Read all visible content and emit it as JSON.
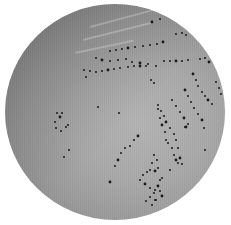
{
  "image": {
    "subject": "agar plate with bacterial colonies in streak pattern",
    "background_color": "#ffffff",
    "plate_color": "#a8a8a8",
    "colony_color": "#1a1a1a"
  },
  "colonies": [
    [
      152,
      22
    ],
    [
      160,
      19
    ],
    [
      176,
      34
    ],
    [
      182,
      33
    ],
    [
      186,
      35
    ],
    [
      163,
      42
    ],
    [
      157,
      44
    ],
    [
      150,
      45
    ],
    [
      143,
      46
    ],
    [
      135,
      47
    ],
    [
      128,
      48
    ],
    [
      122,
      49
    ],
    [
      116,
      50
    ],
    [
      110,
      51
    ],
    [
      96,
      58
    ],
    [
      102,
      60
    ],
    [
      110,
      61
    ],
    [
      118,
      60
    ],
    [
      126,
      59
    ],
    [
      132,
      62
    ],
    [
      140,
      63
    ],
    [
      148,
      64
    ],
    [
      156,
      66
    ],
    [
      164,
      61
    ],
    [
      170,
      61
    ],
    [
      176,
      61
    ],
    [
      182,
      61
    ],
    [
      188,
      60
    ],
    [
      200,
      59
    ],
    [
      205,
      58
    ],
    [
      209,
      62
    ],
    [
      84,
      70
    ],
    [
      90,
      71
    ],
    [
      96,
      72
    ],
    [
      102,
      71
    ],
    [
      108,
      70
    ],
    [
      114,
      69
    ],
    [
      120,
      68
    ],
    [
      128,
      67
    ],
    [
      134,
      66
    ],
    [
      140,
      66
    ],
    [
      146,
      66
    ],
    [
      86,
      77
    ],
    [
      151,
      80
    ],
    [
      154,
      83
    ],
    [
      193,
      74
    ],
    [
      196,
      80
    ],
    [
      198,
      86
    ],
    [
      202,
      92
    ],
    [
      205,
      96
    ],
    [
      208,
      100
    ],
    [
      212,
      104
    ],
    [
      216,
      82
    ],
    [
      219,
      88
    ],
    [
      221,
      94
    ],
    [
      185,
      90
    ],
    [
      188,
      96
    ],
    [
      191,
      102
    ],
    [
      194,
      108
    ],
    [
      198,
      114
    ],
    [
      202,
      120
    ],
    [
      204,
      128
    ],
    [
      172,
      100
    ],
    [
      176,
      106
    ],
    [
      180,
      112
    ],
    [
      184,
      118
    ],
    [
      188,
      124
    ],
    [
      158,
      105
    ],
    [
      161,
      111
    ],
    [
      164,
      116
    ],
    [
      166,
      122
    ],
    [
      170,
      128
    ],
    [
      174,
      134
    ],
    [
      176,
      140
    ],
    [
      178,
      148
    ],
    [
      180,
      158
    ],
    [
      182,
      164
    ],
    [
      98,
      107
    ],
    [
      119,
      113
    ],
    [
      57,
      113
    ],
    [
      60,
      117
    ],
    [
      55,
      122
    ],
    [
      62,
      113
    ],
    [
      158,
      109
    ],
    [
      160,
      118
    ],
    [
      162,
      125
    ],
    [
      165,
      132
    ],
    [
      166,
      140
    ],
    [
      185,
      127
    ],
    [
      205,
      150
    ],
    [
      186,
      127
    ],
    [
      56,
      128
    ],
    [
      61,
      131
    ],
    [
      66,
      127
    ],
    [
      68,
      125
    ],
    [
      138,
      136
    ],
    [
      134,
      140
    ],
    [
      130,
      146
    ],
    [
      125,
      148
    ],
    [
      121,
      153
    ],
    [
      118,
      160
    ],
    [
      115,
      166
    ],
    [
      168,
      143
    ],
    [
      172,
      148
    ],
    [
      174,
      155
    ],
    [
      176,
      160
    ],
    [
      178,
      163
    ],
    [
      170,
      170
    ],
    [
      64,
      157
    ],
    [
      69,
      150
    ],
    [
      110,
      182
    ],
    [
      154,
      155
    ],
    [
      157,
      160
    ],
    [
      152,
      163
    ],
    [
      150,
      170
    ],
    [
      155,
      171
    ],
    [
      158,
      168
    ],
    [
      147,
      172
    ],
    [
      143,
      175
    ],
    [
      140,
      180
    ],
    [
      145,
      184
    ],
    [
      150,
      188
    ],
    [
      155,
      190
    ],
    [
      160,
      180
    ],
    [
      162,
      178
    ],
    [
      158,
      186
    ],
    [
      154,
      193
    ],
    [
      150,
      197
    ],
    [
      146,
      201
    ],
    [
      156,
      200
    ],
    [
      162,
      196
    ],
    [
      160,
      191
    ],
    [
      155,
      200
    ],
    [
      152,
      205
    ]
  ]
}
